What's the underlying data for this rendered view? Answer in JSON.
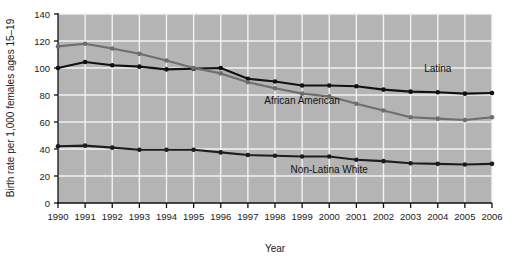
{
  "chart_data": {
    "type": "line",
    "title": "",
    "xlabel": "Year",
    "ylabel": "Birth rate per 1,000 females ages 15–19",
    "x": [
      1990,
      1991,
      1992,
      1993,
      1994,
      1995,
      1996,
      1997,
      1998,
      1999,
      2000,
      2001,
      2002,
      2003,
      2004,
      2005,
      2006
    ],
    "categories": [
      "1990",
      "1991",
      "1992",
      "1993",
      "1994",
      "1995",
      "1996",
      "1997",
      "1998",
      "1999",
      "2000",
      "2001",
      "2002",
      "2003",
      "2004",
      "2005",
      "2006"
    ],
    "xlim": [
      1990,
      2006
    ],
    "ylim": [
      0,
      140
    ],
    "yticks": [
      0,
      20,
      40,
      60,
      80,
      100,
      120,
      140
    ],
    "ytick_labels": [
      "0",
      "20",
      "40",
      "60",
      "80",
      "100",
      "120",
      "140"
    ],
    "grid": true,
    "legend_position": "inline-annotations",
    "plot_background": "#b4b4b4",
    "gridline_color": "#f2f2f2",
    "series": [
      {
        "name": "Latina",
        "color": "#111111",
        "label_x": 2004,
        "label_y": 97,
        "values": [
          100,
          104.5,
          102,
          101,
          99,
          99.5,
          100,
          92,
          90,
          87,
          87,
          86.5,
          84,
          82.5,
          82,
          81,
          81.5
        ]
      },
      {
        "name": "African American",
        "color": "#6e6e6e",
        "label_x": 1999,
        "label_y": 73,
        "values": [
          116,
          118,
          114.5,
          110.5,
          105.5,
          100,
          96,
          89.5,
          85,
          81,
          79,
          73.5,
          68.5,
          63.5,
          62.5,
          61.5,
          63.5
        ]
      },
      {
        "name": "Non-Latina White",
        "color": "#1d1d1d",
        "label_x": 2000,
        "label_y": 22,
        "values": [
          42,
          42.5,
          41,
          39.5,
          39.5,
          39.5,
          37.5,
          35.5,
          35,
          34.5,
          34.5,
          32,
          31,
          29.5,
          29,
          28.5,
          29
        ]
      }
    ]
  }
}
